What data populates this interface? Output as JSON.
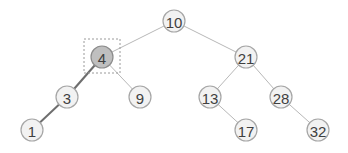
{
  "diagram": {
    "type": "binary-search-tree",
    "selected_node": "4",
    "highlighted_path": [
      "4",
      "3",
      "1"
    ],
    "colors": {
      "node_fill": "#f2f2f2",
      "node_stroke": "#a6a6a6",
      "selected_fill": "#bfbfbf",
      "edge": "#b8b8b8",
      "highlight_edge": "#6e6e6e",
      "label": "#404040"
    },
    "nodes": [
      {
        "id": "10",
        "label": "10",
        "x": 174,
        "y": 21
      },
      {
        "id": "4",
        "label": "4",
        "x": 102,
        "y": 57
      },
      {
        "id": "21",
        "label": "21",
        "x": 246,
        "y": 57
      },
      {
        "id": "3",
        "label": "3",
        "x": 67,
        "y": 97
      },
      {
        "id": "9",
        "label": "9",
        "x": 140,
        "y": 97
      },
      {
        "id": "13",
        "label": "13",
        "x": 210,
        "y": 97
      },
      {
        "id": "28",
        "label": "28",
        "x": 281,
        "y": 97
      },
      {
        "id": "1",
        "label": "1",
        "x": 32,
        "y": 130
      },
      {
        "id": "17",
        "label": "17",
        "x": 246,
        "y": 130
      },
      {
        "id": "32",
        "label": "32",
        "x": 318,
        "y": 130
      }
    ],
    "edges": [
      {
        "from": "10",
        "to": "4",
        "highlight": false
      },
      {
        "from": "10",
        "to": "21",
        "highlight": false
      },
      {
        "from": "4",
        "to": "3",
        "highlight": true
      },
      {
        "from": "4",
        "to": "9",
        "highlight": false
      },
      {
        "from": "3",
        "to": "1",
        "highlight": true
      },
      {
        "from": "21",
        "to": "13",
        "highlight": false
      },
      {
        "from": "21",
        "to": "28",
        "highlight": false
      },
      {
        "from": "13",
        "to": "17",
        "highlight": false
      },
      {
        "from": "28",
        "to": "32",
        "highlight": false
      }
    ]
  }
}
